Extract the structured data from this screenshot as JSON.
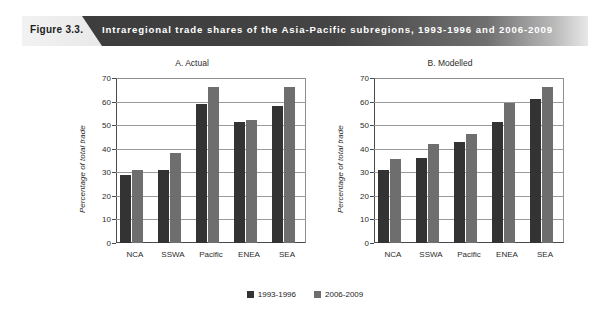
{
  "banner": {
    "figure_label": "Figure 3.3.",
    "title": "Intraregional trade shares of the Asia-Pacific subregions, 1993-1996 and 2006-2009",
    "light_color": "#d8d8d8",
    "dark_color": "#3b3b3b",
    "title_color": "#ffffff"
  },
  "legend": {
    "items": [
      {
        "label": "1993-1996",
        "color": "#333333"
      },
      {
        "label": "2006-2009",
        "color": "#6e6e6e"
      }
    ]
  },
  "axis": {
    "ticks": [
      70,
      60,
      50,
      40,
      30,
      20,
      10,
      0
    ]
  },
  "chart_data": [
    {
      "type": "bar",
      "title": "A. Actual",
      "xlabel": "",
      "ylabel": "Percentage of total trade",
      "ylim": [
        0,
        70
      ],
      "grid": true,
      "legend_position": "bottom",
      "categories": [
        "NCA",
        "SSWA",
        "Pacific",
        "ENEA",
        "SEA"
      ],
      "series": [
        {
          "name": "1993-1996",
          "color": "#333333",
          "values": [
            28.8,
            30.9,
            59.0,
            51.2,
            58.3
          ]
        },
        {
          "name": "2006-2009",
          "color": "#6e6e6e",
          "values": [
            30.8,
            38.1,
            66.3,
            52.2,
            66.3
          ]
        }
      ]
    },
    {
      "type": "bar",
      "title": "B. Modelled",
      "xlabel": "",
      "ylabel": "Percentage of total trade",
      "ylim": [
        0,
        70
      ],
      "grid": true,
      "legend_position": "bottom",
      "categories": [
        "NCA",
        "SSWA",
        "Pacific",
        "ENEA",
        "SEA"
      ],
      "series": [
        {
          "name": "1993-1996",
          "color": "#333333",
          "values": [
            30.8,
            36.0,
            43.0,
            51.2,
            61.3
          ]
        },
        {
          "name": "2006-2009",
          "color": "#6e6e6e",
          "values": [
            35.8,
            42.0,
            46.3,
            59.2,
            66.3
          ]
        }
      ]
    }
  ]
}
